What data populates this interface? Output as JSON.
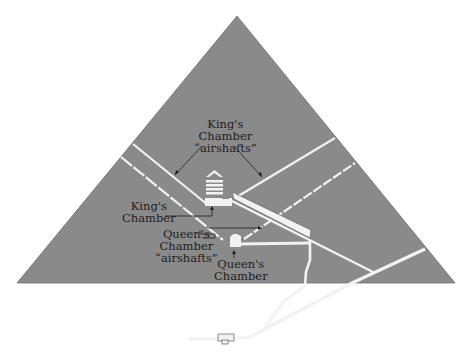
{
  "diagram": {
    "colors": {
      "background": "#ffffff",
      "pyramid": "#8a8a8a",
      "passage": "#f2f2f2",
      "outline": "#2a2a2a",
      "text": "#1e1e1e"
    },
    "labels": {
      "kings_airshafts": [
        "King's",
        "Chamber",
        "“airshafts”"
      ],
      "kings_chamber": [
        "King's",
        "Chamber"
      ],
      "queens_airshafts": [
        "Queen's",
        "Chamber",
        "“airshafts”"
      ],
      "queens_chamber": [
        "Queen's",
        "Chamber"
      ]
    }
  }
}
